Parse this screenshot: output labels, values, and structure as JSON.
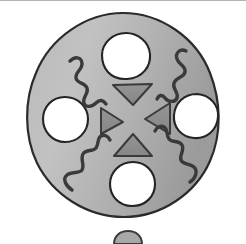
{
  "figure": {
    "title": "Hand-drawn shaded disc with four holes, four inward-pointing triangles and four squiggles",
    "caption": "",
    "background_color": "#ffffff",
    "top_rule_color": "#b4b4b4",
    "disc": {
      "name": "main-disc",
      "fill_light": "#bcbcbc",
      "fill_dark": "#9a9a9a",
      "outline_color": "#2b2b2b",
      "outline_width": 2.2,
      "center_x": 123,
      "center_y": 115,
      "radius_x": 95,
      "radius_y": 102
    },
    "holes": [
      {
        "name": "hole-top",
        "label": "top hole",
        "fill": "#ffffff",
        "outline": "#242424",
        "cx": 126,
        "cy": 56,
        "r": 23
      },
      {
        "name": "hole-left",
        "label": "left hole",
        "fill": "#ffffff",
        "outline": "#242424",
        "cx": 65,
        "cy": 119,
        "r": 22
      },
      {
        "name": "hole-right",
        "label": "right hole",
        "fill": "#ffffff",
        "outline": "#242424",
        "cx": 196,
        "cy": 116,
        "r": 22
      },
      {
        "name": "hole-bottom",
        "label": "bottom hole",
        "fill": "#ffffff",
        "outline": "#242424",
        "cx": 132,
        "cy": 184,
        "r": 22
      }
    ],
    "triangles": [
      {
        "name": "triangle-top",
        "label": "top triangle pointing down",
        "direction": "down",
        "fill": "#8f8f8f",
        "outline": "#3a3a3a",
        "cx": 133,
        "cy": 94
      },
      {
        "name": "triangle-left",
        "label": "left triangle pointing right",
        "direction": "right",
        "fill": "#8f8f8f",
        "outline": "#3a3a3a",
        "cx": 111,
        "cy": 122
      },
      {
        "name": "triangle-right",
        "label": "right triangle pointing left",
        "direction": "left",
        "fill": "#8f8f8f",
        "outline": "#3a3a3a",
        "cx": 158,
        "cy": 119
      },
      {
        "name": "triangle-bottom",
        "label": "bottom triangle pointing up",
        "direction": "up",
        "fill": "#8f8f8f",
        "outline": "#3a3a3a",
        "cx": 133,
        "cy": 145
      }
    ],
    "squiggles": [
      {
        "name": "squiggle-top-left",
        "label": "upper-left squiggle",
        "color": "#3a3a3a",
        "stroke_width": 3.4
      },
      {
        "name": "squiggle-top-right",
        "label": "upper-right squiggle",
        "color": "#3a3a3a",
        "stroke_width": 3.4
      },
      {
        "name": "squiggle-bottom-left",
        "label": "lower-left squiggle",
        "color": "#3a3a3a",
        "stroke_width": 3.4
      },
      {
        "name": "squiggle-bottom-right",
        "label": "lower-right squiggle",
        "color": "#3a3a3a",
        "stroke_width": 3.4
      }
    ],
    "partial_shape_below": {
      "name": "partial-disc-below",
      "label": "cropped top edge of a second disc",
      "outline": "#3d3d3d",
      "fill": "#a8a8a8",
      "cx": 128,
      "cy": 252,
      "rx": 14,
      "ry": 12
    }
  }
}
